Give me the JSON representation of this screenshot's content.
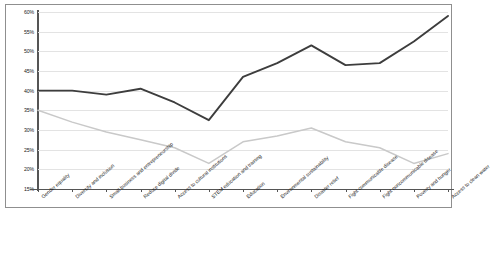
{
  "chart_data": {
    "type": "line",
    "title": "",
    "xlabel": "",
    "ylabel": "",
    "ylim": [
      15,
      60
    ],
    "ytick_values": [
      60,
      55,
      50,
      45,
      40,
      35,
      30,
      25,
      20,
      15
    ],
    "ytick_labels": [
      "60%",
      "55%",
      "50%",
      "45%",
      "40%",
      "35%",
      "30%",
      "25%",
      "20%",
      "15%"
    ],
    "grid": true,
    "legend": "none",
    "categories": [
      "Gender equality",
      "Diversity and inclusion",
      "Small business and entrepreneurship",
      "Reduce digital divide",
      "Access to cultural institutions",
      "STEM education and training",
      "Education",
      "Environmental sustainability",
      "Disaster relief",
      "Fight communicable disease",
      "Fight noncommunicable disease",
      "Poverty and hunger",
      "Access to clean water"
    ],
    "series": [
      {
        "name": "series-dark",
        "color": "#3d3d3d",
        "values": [
          40,
          40,
          39,
          40.5,
          37,
          32.5,
          43.5,
          47,
          51.5,
          46.5,
          47,
          52.5,
          59
        ]
      },
      {
        "name": "series-light",
        "color": "#c9c9c9",
        "values": [
          35,
          32,
          29.5,
          27.5,
          25.5,
          21.5,
          27,
          28.5,
          30.5,
          27,
          25.5,
          21.5,
          24
        ]
      }
    ]
  }
}
